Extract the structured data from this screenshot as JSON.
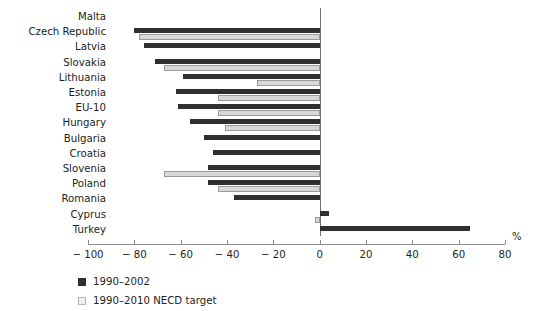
{
  "chart_data": {
    "type": "bar",
    "orientation": "horizontal",
    "title": "",
    "xlabel": "%",
    "ylabel": "",
    "xlim": [
      -100,
      80
    ],
    "xticks": [
      -100,
      -80,
      -60,
      -40,
      -20,
      0,
      20,
      40,
      60,
      80
    ],
    "xtick_labels": [
      "− 100",
      "− 80",
      "− 60",
      "− 40",
      "− 20",
      "0",
      "20",
      "40",
      "60",
      "80"
    ],
    "grid": false,
    "legend_position": "below-left",
    "categories": [
      "Malta",
      "Czech Republic",
      "Latvia",
      "Slovakia",
      "Lithuania",
      "Estonia",
      "EU-10",
      "Hungary",
      "Bulgaria",
      "Croatia",
      "Slovenia",
      "Poland",
      "Romania",
      "Cyprus",
      "Turkey"
    ],
    "series": [
      {
        "name": "1990–2002",
        "color": "#2f2f2f",
        "values": [
          null,
          -80,
          -76,
          -71,
          -59,
          -62,
          -61,
          -56,
          -50,
          -46,
          -48,
          -48,
          -37,
          4,
          65
        ]
      },
      {
        "name": "1990–2010 NECD target",
        "color": "#d8d8d8",
        "values": [
          null,
          -78,
          null,
          -67,
          -27,
          -44,
          -44,
          -41,
          null,
          null,
          -67,
          -44,
          null,
          -2,
          null
        ]
      }
    ]
  },
  "legend": {
    "items": [
      {
        "label": "1990–2002",
        "swatch": "dark"
      },
      {
        "label": "1990–2010 NECD target",
        "swatch": "light"
      }
    ]
  },
  "axis": {
    "unit_label": "%"
  }
}
